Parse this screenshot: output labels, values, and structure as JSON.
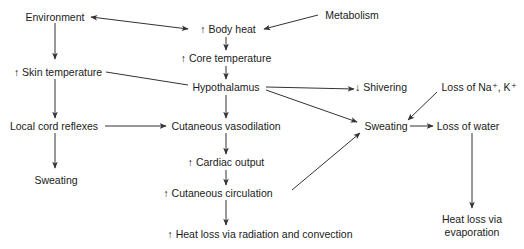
{
  "diagram": {
    "type": "flowchart",
    "colors": {
      "line": "#333333",
      "text": "#1a1a1a",
      "background": "#ffffff"
    },
    "nodes": [
      {
        "id": "environment",
        "label": "Environment"
      },
      {
        "id": "body_heat",
        "label": "↑ Body heat"
      },
      {
        "id": "metabolism",
        "label": "Metabolism"
      },
      {
        "id": "core_temp",
        "label": "↑ Core temperature"
      },
      {
        "id": "skin_temp",
        "label": "↑ Skin temperature"
      },
      {
        "id": "hypothalamus",
        "label": "Hypothalamus"
      },
      {
        "id": "shivering",
        "label": "↓ Shivering"
      },
      {
        "id": "loss_na_k",
        "label": "Loss of Na⁺, K⁺"
      },
      {
        "id": "local_cord",
        "label": "Local cord reflexes"
      },
      {
        "id": "cut_vasodilation",
        "label": "Cutaneous vasodilation"
      },
      {
        "id": "sweating_center",
        "label": "Sweating"
      },
      {
        "id": "loss_water",
        "label": "Loss of water"
      },
      {
        "id": "cardiac_output",
        "label": "↑ Cardiac output"
      },
      {
        "id": "sweating_left",
        "label": "Sweating"
      },
      {
        "id": "cut_circulation",
        "label": "↑ Cutaneous circulation"
      },
      {
        "id": "heat_loss_rad",
        "label": "↑ Heat loss via radiation and convection"
      },
      {
        "id": "heat_loss_evap",
        "label": "Heat loss via evaporation"
      }
    ],
    "edges": [
      {
        "from": "environment",
        "to": "body_heat",
        "bidirectional": true
      },
      {
        "from": "metabolism",
        "to": "body_heat"
      },
      {
        "from": "body_heat",
        "to": "core_temp"
      },
      {
        "from": "core_temp",
        "to": "hypothalamus"
      },
      {
        "from": "environment",
        "to": "skin_temp"
      },
      {
        "from": "skin_temp",
        "to": "hypothalamus",
        "arrowhead": false
      },
      {
        "from": "skin_temp",
        "to": "local_cord"
      },
      {
        "from": "hypothalamus",
        "to": "shivering"
      },
      {
        "from": "hypothalamus",
        "to": "sweating_center"
      },
      {
        "from": "hypothalamus",
        "to": "cut_vasodilation"
      },
      {
        "from": "local_cord",
        "to": "cut_vasodilation"
      },
      {
        "from": "local_cord",
        "to": "sweating_left"
      },
      {
        "from": "cut_vasodilation",
        "to": "cardiac_output"
      },
      {
        "from": "cardiac_output",
        "to": "cut_circulation"
      },
      {
        "from": "cut_circulation",
        "to": "heat_loss_rad"
      },
      {
        "from": "cut_circulation",
        "to": "sweating_center"
      },
      {
        "from": "loss_na_k",
        "to": "sweating_center"
      },
      {
        "from": "sweating_center",
        "to": "loss_water"
      },
      {
        "from": "loss_water",
        "to": "heat_loss_evap"
      }
    ]
  }
}
